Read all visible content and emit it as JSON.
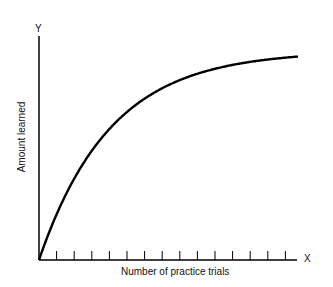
{
  "chart_data": {
    "type": "line",
    "title": "",
    "xlabel": "Number of practice trials",
    "ylabel": "Amount learned",
    "x_axis_letter": "X",
    "y_axis_letter": "Y",
    "x": [
      0,
      1,
      2,
      3,
      4,
      5,
      6,
      7,
      8,
      9,
      10,
      11,
      12,
      13,
      14
    ],
    "series": [
      {
        "name": "Learning curve",
        "values": [
          0,
          22,
          39,
          52,
          63,
          71,
          78,
          83,
          87,
          90,
          92,
          94,
          95,
          96,
          97
        ]
      }
    ],
    "tick_count": 14,
    "grid": false,
    "legend": "none",
    "colors": {
      "line": "#000000",
      "axis": "#000000"
    }
  }
}
